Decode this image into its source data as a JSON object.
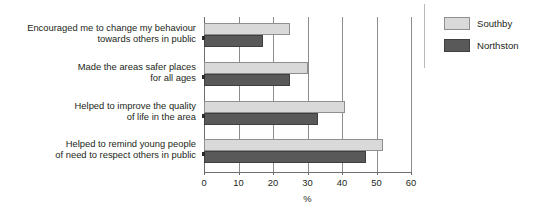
{
  "chart_data": {
    "type": "bar",
    "orientation": "horizontal",
    "title": "",
    "xlabel": "%",
    "ylabel": "",
    "xlim": [
      0,
      60
    ],
    "xticks": [
      0,
      10,
      20,
      30,
      40,
      50,
      60
    ],
    "grid": true,
    "legend_position": "right",
    "categories": [
      "Encouraged me to change my behaviour\ntowards others in public",
      "Made the areas safer places\nfor all ages",
      "Helped to improve the quality\nof life in the area",
      "Helped to remind young people\nof need to respect others in public"
    ],
    "series": [
      {
        "name": "Southby",
        "color": "#d9d9d9",
        "values": [
          25,
          30,
          41,
          52
        ]
      },
      {
        "name": "Northston",
        "color": "#595959",
        "values": [
          17,
          25,
          33,
          47
        ]
      }
    ]
  },
  "caption_remnant": "",
  "legend": {
    "items": [
      {
        "label": "Southby",
        "swatch": "light"
      },
      {
        "label": "Northston",
        "swatch": "dark"
      }
    ]
  },
  "axis": {
    "x_title": "%",
    "tick_labels": [
      "0",
      "10",
      "20",
      "30",
      "40",
      "50",
      "60"
    ]
  }
}
